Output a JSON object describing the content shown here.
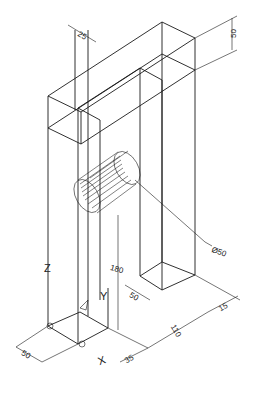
{
  "drawing": {
    "type": "isometric-wireframe",
    "background": "#ffffff",
    "line_color": "#1a1a1a",
    "dimensions": [
      {
        "id": "top-width",
        "label": "25"
      },
      {
        "id": "top-height",
        "label": "50"
      },
      {
        "id": "hole-diameter",
        "label": "Ø50"
      },
      {
        "id": "hole-height",
        "label": "180"
      },
      {
        "id": "right-pillar-depth",
        "label": "50"
      },
      {
        "id": "base-depth-left",
        "label": "50"
      },
      {
        "id": "gap-length",
        "label": "110"
      },
      {
        "id": "right-pillar-width",
        "label": "15"
      },
      {
        "id": "left-offset",
        "label": "35"
      }
    ],
    "axes": {
      "z": "Z",
      "y": "Y",
      "x": "X"
    }
  }
}
